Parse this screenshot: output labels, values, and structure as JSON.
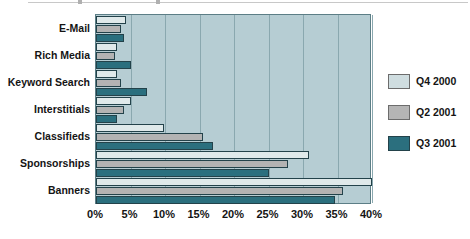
{
  "chart_data": {
    "type": "bar",
    "orientation": "horizontal",
    "title": "",
    "xlabel": "",
    "ylabel": "",
    "xlim": [
      0,
      40
    ],
    "xticks": [
      "0%",
      "5%",
      "10%",
      "15%",
      "20%",
      "25%",
      "30%",
      "35%",
      "40%"
    ],
    "xtick_values": [
      0,
      5,
      10,
      15,
      20,
      25,
      30,
      35,
      40
    ],
    "grid": true,
    "legend_position": "right",
    "categories": [
      "E-Mail",
      "Rich Media",
      "Keyword Search",
      "Interstitials",
      "Classifieds",
      "Sponsorships",
      "Banners"
    ],
    "series": [
      {
        "name": "Q4 2000",
        "color": "#dfe9ea",
        "values": [
          4.3,
          3.0,
          3.0,
          5.0,
          9.8,
          30.8,
          40.0
        ]
      },
      {
        "name": "Q2 2001",
        "color": "#b3b3b3",
        "values": [
          3.6,
          2.8,
          3.6,
          4.0,
          15.5,
          27.8,
          35.8
        ]
      },
      {
        "name": "Q3 2001",
        "color": "#2b6f7e",
        "values": [
          4.0,
          5.0,
          7.4,
          3.0,
          17.0,
          25.0,
          34.6
        ]
      }
    ]
  },
  "legend": {
    "items": [
      {
        "label": "Q4 2000"
      },
      {
        "label": "Q2 2001"
      },
      {
        "label": "Q3 2001"
      }
    ]
  }
}
